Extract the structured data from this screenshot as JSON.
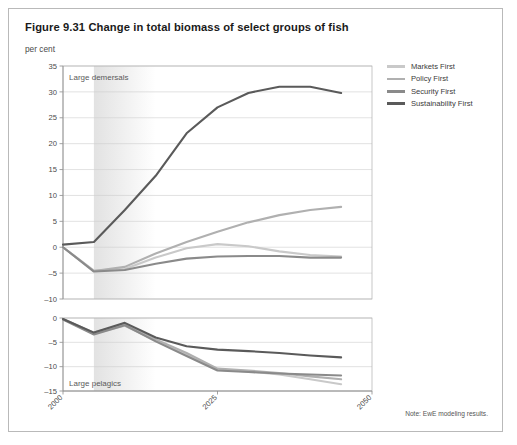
{
  "figure": {
    "title": "Figure 9.31 Change in total biomass of select groups of fish",
    "unit": "per cent",
    "note": "Note: EwE modeling results."
  },
  "legend": {
    "position": "right",
    "items": [
      {
        "label": "Markets First",
        "color": "#c9c9c9"
      },
      {
        "label": "Policy First",
        "color": "#b0b0b0"
      },
      {
        "label": "Security First",
        "color": "#8a8a8a"
      },
      {
        "label": "Sustainability First",
        "color": "#5a5a5a"
      }
    ]
  },
  "chart_data": [
    {
      "type": "line",
      "panel": "top",
      "title": "Large demersals",
      "xlabel": "",
      "ylabel": "per cent",
      "x": [
        2000,
        2005,
        2010,
        2015,
        2020,
        2025,
        2030,
        2035,
        2040,
        2045
      ],
      "xticks": [
        2000,
        2025,
        2050
      ],
      "xlim": [
        2000,
        2050
      ],
      "ylim": [
        -10,
        35
      ],
      "yticks": [
        -10,
        -5,
        0,
        5,
        10,
        15,
        20,
        25,
        30,
        35
      ],
      "grid": true,
      "shaded_band": {
        "from": 2005,
        "to": 2015,
        "color": "#e2e2e2"
      },
      "series": [
        {
          "name": "Markets First",
          "color": "#c9c9c9",
          "values": [
            0.0,
            -4.5,
            -4.2,
            -2.0,
            -0.2,
            0.6,
            0.2,
            -0.8,
            -1.5,
            -1.8
          ]
        },
        {
          "name": "Policy First",
          "color": "#b0b0b0",
          "values": [
            0.0,
            -4.6,
            -3.8,
            -1.2,
            1.0,
            3.0,
            4.8,
            6.2,
            7.2,
            7.8
          ]
        },
        {
          "name": "Security First",
          "color": "#8a8a8a",
          "values": [
            0.0,
            -4.7,
            -4.4,
            -3.2,
            -2.2,
            -1.8,
            -1.7,
            -1.7,
            -2.0,
            -2.0
          ]
        },
        {
          "name": "Sustainability First",
          "color": "#5a5a5a",
          "values": [
            0.5,
            1.0,
            7.2,
            13.8,
            22.0,
            27.0,
            29.8,
            31.0,
            31.0,
            29.8
          ]
        }
      ]
    },
    {
      "type": "line",
      "panel": "bottom",
      "title": "Large pelagics",
      "xlabel": "",
      "ylabel": "",
      "x": [
        2000,
        2005,
        2010,
        2015,
        2020,
        2025,
        2030,
        2035,
        2040,
        2045
      ],
      "xticks": [
        2000,
        2025,
        2050
      ],
      "xlim": [
        2000,
        2050
      ],
      "ylim": [
        -15,
        0
      ],
      "yticks": [
        -15,
        -10,
        -5,
        0
      ],
      "grid": true,
      "shaded_band": {
        "from": 2005,
        "to": 2015,
        "color": "#e2e2e2"
      },
      "series": [
        {
          "name": "Markets First",
          "color": "#c9c9c9",
          "values": [
            -0.2,
            -3.2,
            -1.6,
            -4.6,
            -7.4,
            -10.6,
            -11.0,
            -11.6,
            -12.6,
            -13.6
          ]
        },
        {
          "name": "Policy First",
          "color": "#b0b0b0",
          "values": [
            -0.2,
            -3.0,
            -1.3,
            -4.4,
            -7.2,
            -10.4,
            -10.8,
            -11.3,
            -12.0,
            -12.6
          ]
        },
        {
          "name": "Security First",
          "color": "#8a8a8a",
          "values": [
            -0.3,
            -3.4,
            -1.5,
            -4.8,
            -7.8,
            -10.8,
            -11.1,
            -11.4,
            -11.6,
            -11.8
          ]
        },
        {
          "name": "Sustainability First",
          "color": "#5a5a5a",
          "values": [
            -0.2,
            -3.0,
            -1.0,
            -4.0,
            -5.8,
            -6.5,
            -6.8,
            -7.2,
            -7.7,
            -8.1
          ]
        }
      ]
    }
  ]
}
